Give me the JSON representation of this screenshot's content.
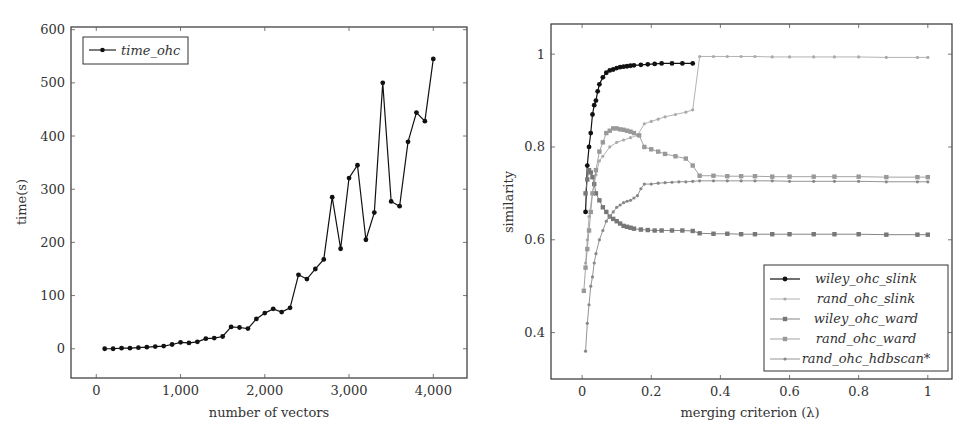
{
  "chart_data": [
    {
      "type": "line",
      "title": "",
      "xlabel": "number of vectors",
      "ylabel": "time(s)",
      "xlim": [
        -300,
        4400
      ],
      "ylim": [
        -55,
        605
      ],
      "xticks": [
        0,
        1000,
        2000,
        3000,
        4000
      ],
      "xtick_labels": [
        "0",
        "1,000",
        "2,000",
        "3,000",
        "4,000"
      ],
      "yticks": [
        0,
        100,
        200,
        300,
        400,
        500,
        600
      ],
      "ytick_labels": [
        "0",
        "100",
        "200",
        "300",
        "400",
        "500",
        "600"
      ],
      "grid": false,
      "legend_position": "upper left",
      "series": [
        {
          "name": "time_ohc",
          "color": "#111111",
          "marker": "circle",
          "x": [
            100,
            200,
            300,
            400,
            500,
            600,
            700,
            800,
            900,
            1000,
            1100,
            1200,
            1300,
            1400,
            1500,
            1600,
            1700,
            1800,
            1900,
            2000,
            2100,
            2200,
            2300,
            2400,
            2500,
            2600,
            2700,
            2800,
            2900,
            3000,
            3100,
            3200,
            3300,
            3400,
            3500,
            3600,
            3700,
            3800,
            3900,
            4000
          ],
          "values": [
            0,
            0,
            1,
            1,
            2,
            3,
            4,
            5,
            8,
            12,
            11,
            13,
            19,
            20,
            23,
            41,
            40,
            38,
            56,
            67,
            75,
            69,
            77,
            139,
            131,
            150,
            168,
            285,
            188,
            321,
            345,
            205,
            256,
            500,
            277,
            268,
            389,
            444,
            428,
            545
          ]
        }
      ]
    },
    {
      "type": "line",
      "title": "",
      "xlabel": "merging criterion (λ)",
      "ylabel": "similarity",
      "xlim": [
        -0.09,
        1.07
      ],
      "ylim": [
        0.3,
        1.065
      ],
      "xticks": [
        0,
        0.2,
        0.4,
        0.6,
        0.8,
        1
      ],
      "xtick_labels": [
        "0",
        "0.2",
        "0.4",
        "0.6",
        "0.8",
        "1"
      ],
      "yticks": [
        0.4,
        0.6,
        0.8,
        1
      ],
      "ytick_labels": [
        "0.4",
        "0.6",
        "0.8",
        "1"
      ],
      "grid": false,
      "legend_position": "lower right",
      "series": [
        {
          "name": "wiley_ohc_slink",
          "color": "#111111",
          "marker": "circle",
          "x": [
            0.01,
            0.015,
            0.02,
            0.025,
            0.03,
            0.035,
            0.04,
            0.045,
            0.05,
            0.06,
            0.07,
            0.08,
            0.09,
            0.1,
            0.11,
            0.12,
            0.13,
            0.14,
            0.15,
            0.17,
            0.19,
            0.21,
            0.23,
            0.26,
            0.29,
            0.32
          ],
          "values": [
            0.66,
            0.76,
            0.8,
            0.83,
            0.87,
            0.89,
            0.9,
            0.92,
            0.935,
            0.95,
            0.96,
            0.965,
            0.967,
            0.97,
            0.972,
            0.973,
            0.974,
            0.975,
            0.976,
            0.977,
            0.978,
            0.979,
            0.98,
            0.98,
            0.98,
            0.98
          ]
        },
        {
          "name": "rand_ohc_slink",
          "color": "#aaaaaa",
          "marker": "circle-small",
          "x": [
            0.01,
            0.015,
            0.02,
            0.03,
            0.04,
            0.05,
            0.06,
            0.08,
            0.1,
            0.12,
            0.14,
            0.16,
            0.18,
            0.2,
            0.22,
            0.24,
            0.27,
            0.3,
            0.32,
            0.34,
            0.38,
            0.42,
            0.46,
            0.5,
            0.55,
            0.6,
            0.67,
            0.73,
            0.8,
            0.88,
            0.97,
            1.0
          ],
          "values": [
            0.55,
            0.6,
            0.65,
            0.7,
            0.74,
            0.77,
            0.78,
            0.8,
            0.81,
            0.815,
            0.82,
            0.825,
            0.85,
            0.855,
            0.86,
            0.865,
            0.87,
            0.875,
            0.88,
            0.995,
            0.995,
            0.995,
            0.995,
            0.995,
            0.994,
            0.994,
            0.994,
            0.994,
            0.994,
            0.993,
            0.993,
            0.993
          ]
        },
        {
          "name": "wiley_ohc_ward",
          "color": "#777777",
          "marker": "square",
          "x": [
            0.01,
            0.015,
            0.02,
            0.025,
            0.03,
            0.035,
            0.04,
            0.05,
            0.06,
            0.07,
            0.08,
            0.09,
            0.1,
            0.11,
            0.12,
            0.13,
            0.14,
            0.15,
            0.17,
            0.19,
            0.21,
            0.23,
            0.26,
            0.29,
            0.32,
            0.34,
            0.38,
            0.42,
            0.46,
            0.5,
            0.55,
            0.6,
            0.67,
            0.73,
            0.8,
            0.88,
            0.97,
            1.0
          ],
          "values": [
            0.7,
            0.73,
            0.75,
            0.745,
            0.735,
            0.72,
            0.7,
            0.685,
            0.67,
            0.66,
            0.65,
            0.645,
            0.64,
            0.635,
            0.63,
            0.628,
            0.626,
            0.624,
            0.622,
            0.621,
            0.62,
            0.62,
            0.62,
            0.62,
            0.619,
            0.614,
            0.613,
            0.613,
            0.612,
            0.612,
            0.612,
            0.612,
            0.612,
            0.612,
            0.612,
            0.611,
            0.611,
            0.611
          ]
        },
        {
          "name": "rand_ohc_ward",
          "color": "#999999",
          "marker": "square",
          "x": [
            0.005,
            0.01,
            0.015,
            0.02,
            0.025,
            0.03,
            0.04,
            0.05,
            0.06,
            0.07,
            0.08,
            0.09,
            0.1,
            0.11,
            0.12,
            0.13,
            0.14,
            0.15,
            0.165,
            0.18,
            0.2,
            0.22,
            0.24,
            0.27,
            0.3,
            0.32,
            0.34,
            0.38,
            0.42,
            0.46,
            0.5,
            0.55,
            0.6,
            0.67,
            0.73,
            0.8,
            0.88,
            0.97,
            1.0
          ],
          "values": [
            0.49,
            0.54,
            0.58,
            0.62,
            0.66,
            0.7,
            0.75,
            0.79,
            0.81,
            0.83,
            0.835,
            0.84,
            0.84,
            0.838,
            0.837,
            0.835,
            0.833,
            0.83,
            0.825,
            0.8,
            0.795,
            0.79,
            0.785,
            0.78,
            0.775,
            0.76,
            0.738,
            0.738,
            0.737,
            0.737,
            0.737,
            0.736,
            0.736,
            0.736,
            0.736,
            0.736,
            0.735,
            0.735,
            0.735
          ]
        },
        {
          "name": "rand_ohc_hdbscan*",
          "color": "#888888",
          "marker": "star",
          "x": [
            0.01,
            0.015,
            0.02,
            0.025,
            0.03,
            0.035,
            0.04,
            0.05,
            0.06,
            0.07,
            0.08,
            0.09,
            0.1,
            0.11,
            0.12,
            0.13,
            0.14,
            0.15,
            0.16,
            0.17,
            0.18,
            0.2,
            0.22,
            0.24,
            0.26,
            0.28,
            0.3,
            0.32,
            0.34,
            0.38,
            0.42,
            0.46,
            0.5,
            0.55,
            0.6,
            0.67,
            0.73,
            0.8,
            0.88,
            0.97,
            1.0
          ],
          "values": [
            0.36,
            0.42,
            0.46,
            0.5,
            0.52,
            0.55,
            0.57,
            0.6,
            0.62,
            0.64,
            0.65,
            0.66,
            0.67,
            0.675,
            0.68,
            0.683,
            0.685,
            0.69,
            0.695,
            0.71,
            0.72,
            0.72,
            0.722,
            0.723,
            0.724,
            0.725,
            0.725,
            0.726,
            0.727,
            0.727,
            0.727,
            0.727,
            0.727,
            0.727,
            0.726,
            0.726,
            0.726,
            0.726,
            0.725,
            0.725,
            0.725
          ]
        }
      ]
    }
  ],
  "left_chart": {
    "ylabel": "time(s)",
    "xlabel": "number of vectors",
    "legend": [
      "time_ohc"
    ]
  },
  "right_chart": {
    "ylabel": "similarity",
    "xlabel": "merging criterion (λ)",
    "legend": [
      "wiley_ohc_slink",
      "rand_ohc_slink",
      "wiley_ohc_ward",
      "rand_ohc_ward",
      "rand_ohc_hdbscan*"
    ]
  }
}
